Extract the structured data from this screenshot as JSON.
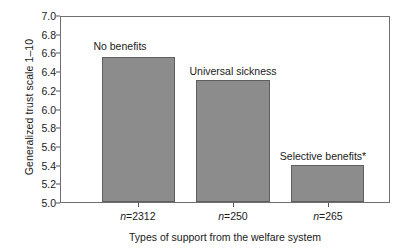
{
  "chart_data": {
    "type": "bar",
    "title": "",
    "xlabel": "Types of support from the welfare system",
    "ylabel": "Generalized trust scale 1–10",
    "categories": [
      "No benefits",
      "Universal sickness",
      "Selective benefits*"
    ],
    "values": [
      6.55,
      6.3,
      5.4
    ],
    "ylim": [
      5.0,
      7.0
    ],
    "ytick_labels": [
      "7.0",
      "6.8",
      "6.6",
      "6.4",
      "6.2",
      "6.0",
      "5.8",
      "5.6",
      "5.4",
      "5.2",
      "5.0"
    ],
    "ytick_values": [
      7.0,
      6.8,
      6.6,
      6.4,
      6.2,
      6.0,
      5.8,
      5.6,
      5.4,
      5.2,
      5.0
    ],
    "xtick_labels": [
      "n=2312",
      "n=250",
      "n=265"
    ],
    "sample_sizes": [
      2312,
      250,
      265
    ],
    "grid": false,
    "legend": false,
    "bar_color": "#8c8c8c",
    "bar_edge_color": "#5f5f5f",
    "axis_color": "#6f6f6f"
  },
  "bars": [
    {
      "label": "No benefits",
      "value": 6.55,
      "n_prefix": "n",
      "n_eq": "=",
      "n_value": "2312",
      "n_label": "n=2312",
      "left_pct": 12.4,
      "width_pct": 22.4,
      "center_pct": 23.6,
      "label_top": 40,
      "label_left": 120
    },
    {
      "label": "Universal sickness",
      "value": 6.3,
      "n_prefix": "n",
      "n_eq": "=",
      "n_value": "250",
      "n_label": "n=250",
      "left_pct": 41.2,
      "width_pct": 22.4,
      "center_pct": 52.4,
      "label_top": 65,
      "label_left": 233
    },
    {
      "label": "Selective benefits*",
      "value": 5.4,
      "n_prefix": "n",
      "n_eq": "=",
      "n_value": "265",
      "n_label": "n=265",
      "left_pct": 70.0,
      "width_pct": 22.4,
      "center_pct": 81.2,
      "label_top": 150,
      "label_left": 323
    }
  ]
}
